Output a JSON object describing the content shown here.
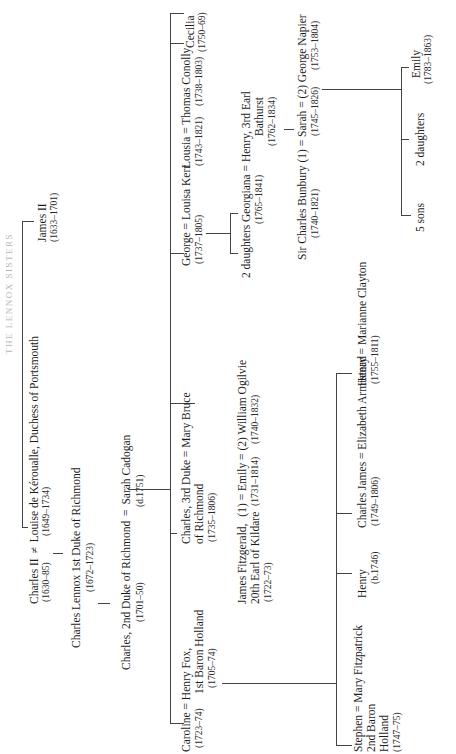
{
  "title": "THE LENNOX SISTERS",
  "generation1": {
    "charles_ii": {
      "name": "Charles II",
      "dates": "(1630–85)"
    },
    "marriage_symbol": "≠",
    "louise": {
      "name": "Louise de Kéroualle, Duchess of Portsmouth",
      "dates": "(1649–1734)"
    },
    "james_ii": {
      "name": "James II",
      "dates": "(1633–1701)"
    }
  },
  "generation2": {
    "charles_lennox": {
      "name": "Charles Lennox 1st Duke of Richmond",
      "dates": "(1672–1723)"
    }
  },
  "generation3": {
    "charles_2nd": {
      "name": "Charles, 2nd Duke of Richmond",
      "dates": "(1701–50)"
    },
    "eq": "=",
    "sarah_cadogan": {
      "name": "Sarah Cadogan",
      "dates": "(d.1751)"
    }
  },
  "generation4": {
    "caroline": {
      "name": "Caroline",
      "dates": "(1723–74)"
    },
    "henry_fox": {
      "line1": "Henry Fox,",
      "line2": "1st Baron Holland",
      "dates": "(1705–74)"
    },
    "charles_3rd": {
      "line1": "Charles, 3rd Duke",
      "line2": "of Richmond",
      "dates": "(1735–1806)",
      "spouse": "Mary Bruce"
    },
    "james_fitzgerald": {
      "line1": "James Fitzgerald,",
      "line2": "20th Earl of Kildare",
      "dates": "(1722–73)"
    },
    "emily": {
      "prefix": "(1)",
      "name": "Emily",
      "dates": "(1731–1814)",
      "second": "(2) William Ogilvie",
      "second_dates": "(1740–1832)"
    },
    "george": {
      "name": "George",
      "dates": "(1737–1805)",
      "spouse": "Louisa Kerr"
    },
    "lousia": {
      "name": "Lousia",
      "dates": "(1743–1821)",
      "spouse": "Thomas Conolly",
      "spouse_dates": "(1738–1803)"
    },
    "cecilia": {
      "name": "Cecilia",
      "dates": "(1750–69)"
    },
    "bunbury": {
      "name": "Sir Charles Bunbury",
      "prefix": "(1)",
      "dates": "(1740–1821)"
    },
    "sarah": {
      "name": "Sarah",
      "dates": "(1745–1826)"
    },
    "napier": {
      "name": "(2) George Napier",
      "dates": "(1753–1804)"
    }
  },
  "generation5": {
    "stephen": {
      "name": "Stephen",
      "line2": "2nd Baron",
      "line3": "Holland",
      "dates": "(1747–75)",
      "spouse": "Mary Fitzpatrick"
    },
    "henry_b": {
      "name": "Henry",
      "dates": "(b.1746)"
    },
    "charles_james": {
      "name": "Charles James",
      "dates": "(1749–1806)",
      "spouse": "Elizabeth Armistead"
    },
    "henry2": {
      "name": "Henry",
      "dates": "(1755–1811)",
      "spouse": "Marianne Clayton"
    },
    "george_daughters": {
      "label": "2 daughters"
    },
    "georgiana": {
      "name": "Georgiana",
      "dates": "(1765–1841)",
      "spouse_line1": "Henry, 3rd Earl",
      "spouse_line2": "Bathurst",
      "spouse_dates": "(1762–1834)"
    },
    "five_sons": {
      "label": "5 sons"
    },
    "sarah_daughters": {
      "label": "2 daughters"
    },
    "emily_napier": {
      "name": "Emily",
      "dates": "(1783–1863)"
    }
  }
}
